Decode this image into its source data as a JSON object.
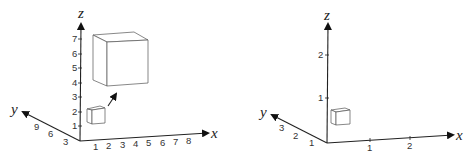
{
  "diagrams": [
    {
      "id": "left",
      "axes": {
        "x": {
          "label": "x",
          "ticks": [
            "1",
            "2",
            "3",
            "4",
            "5",
            "6",
            "7",
            "8"
          ]
        },
        "y": {
          "label": "y",
          "ticks": [
            "3",
            "6",
            "9"
          ]
        },
        "z": {
          "label": "z",
          "ticks": [
            "1",
            "2",
            "3",
            "4",
            "5",
            "6",
            "7"
          ]
        }
      },
      "shapes": [
        "small-cube",
        "large-cube",
        "scaling-arrow"
      ]
    },
    {
      "id": "right",
      "axes": {
        "x": {
          "label": "x",
          "ticks": [
            "1",
            "2"
          ]
        },
        "y": {
          "label": "y",
          "ticks": [
            "1",
            "2",
            "3"
          ]
        },
        "z": {
          "label": "z",
          "ticks": [
            "1",
            "2"
          ]
        }
      },
      "shapes": [
        "small-cube"
      ]
    }
  ]
}
